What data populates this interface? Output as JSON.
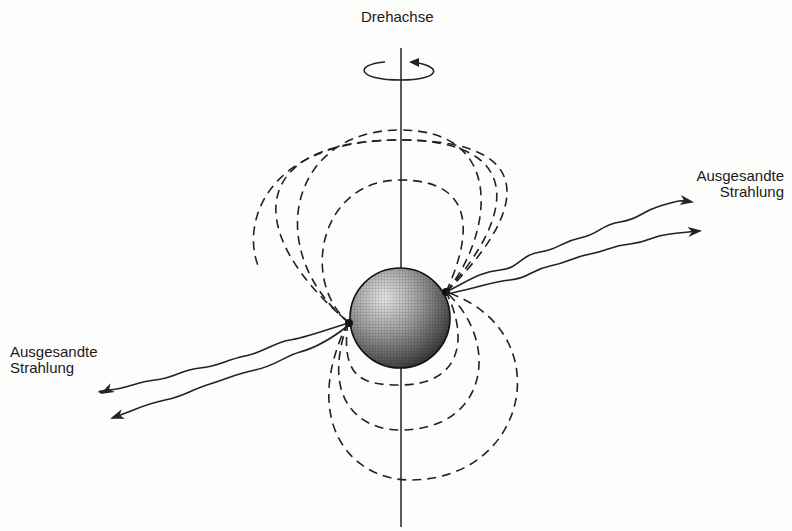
{
  "diagram": {
    "type": "pulsar-schematic",
    "labels": {
      "rotation_axis": "Drehachse",
      "radiation_right_line1": "Ausgesandte",
      "radiation_right_line2": "Strahlung",
      "radiation_left_line1": "Ausgesandte",
      "radiation_left_line2": "Strahlung"
    },
    "elements": {
      "rotation_axis": "vertical line",
      "rotation_arrow": "circular arrow around axis",
      "neutron_star": "shaded sphere",
      "field_lines": "dashed dipole loops (3 upper-left, 3 lower-right)",
      "beams": "two wavy arrows from each magnetic pole"
    },
    "colors": {
      "ink": "#222222",
      "background": "#fdfdfc"
    }
  }
}
